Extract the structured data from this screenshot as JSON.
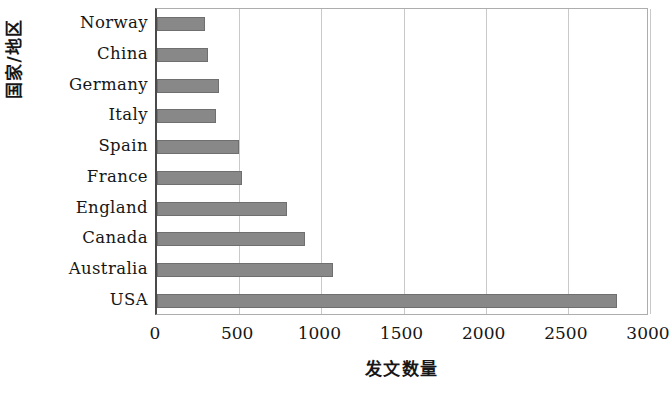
{
  "chart_data": {
    "type": "bar",
    "orientation": "horizontal",
    "title": "",
    "xlabel": "发文数量",
    "ylabel": "国家/地区",
    "categories": [
      "USA",
      "Australia",
      "Canada",
      "England",
      "France",
      "Spain",
      "Italy",
      "Germany",
      "China",
      "Norway"
    ],
    "values": [
      2800,
      1070,
      900,
      790,
      520,
      500,
      360,
      380,
      310,
      290
    ],
    "xlim": [
      0,
      3000
    ],
    "xticks": [
      0,
      500,
      1000,
      1500,
      2000,
      2500,
      3000
    ],
    "xtick_labels": [
      "0",
      "500",
      "1000",
      "1500",
      "2000",
      "2500",
      "3000"
    ],
    "grid": "vertical",
    "legend": null,
    "bar_color": "#888888",
    "bar_edge_color": "#6f6f6f",
    "axis_color": "#4a4a4a",
    "gridline_color": "#c9c9c9"
  }
}
